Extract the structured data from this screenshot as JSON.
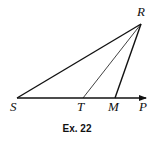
{
  "figure": {
    "caption": "Ex. 22",
    "points": {
      "R": {
        "label": "R",
        "x": 141,
        "y": 24
      },
      "S": {
        "label": "S",
        "x": 17,
        "y": 98
      },
      "T": {
        "label": "T",
        "x": 83,
        "y": 98
      },
      "M": {
        "label": "M",
        "x": 115,
        "y": 98
      },
      "P": {
        "label": "P",
        "x": 146,
        "y": 98
      }
    },
    "segments": [
      {
        "from": "S",
        "to": "R",
        "weight": "thick"
      },
      {
        "from": "T",
        "to": "R",
        "weight": "thin"
      },
      {
        "from": "M",
        "to": "R",
        "weight": "thick"
      },
      {
        "from": "S",
        "to": "P",
        "weight": "thick",
        "arrow": true
      }
    ],
    "line_color": "#111111"
  }
}
